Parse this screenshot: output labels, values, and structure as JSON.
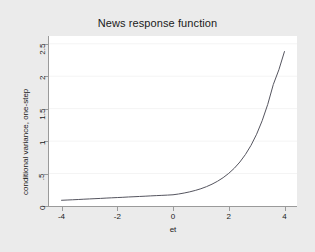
{
  "chart_data": {
    "type": "line",
    "title": "News response function",
    "xlabel": "et",
    "ylabel": "conditional variance, one-step",
    "xlim": [
      -4.45,
      4.45
    ],
    "ylim": [
      0,
      2.62
    ],
    "xticks": [
      "-4",
      "-2",
      "0",
      "2",
      "4"
    ],
    "xtick_values": [
      -4,
      -2,
      0,
      2,
      4
    ],
    "yticks": [
      "0",
      ".5",
      "1",
      "1.5",
      "2",
      "2.5"
    ],
    "ytick_values": [
      0,
      0.5,
      1,
      1.5,
      2,
      2.5
    ],
    "grid": true,
    "grid_axis": "y",
    "legend": "none",
    "series": [
      {
        "name": "conditional variance, one-step",
        "color": "#55555f",
        "x": [
          -4.0,
          -3.8,
          -3.6,
          -3.4,
          -3.2,
          -3.0,
          -2.8,
          -2.6,
          -2.4,
          -2.2,
          -2.0,
          -1.8,
          -1.6,
          -1.4,
          -1.2,
          -1.0,
          -0.8,
          -0.6,
          -0.4,
          -0.2,
          0.0,
          0.2,
          0.4,
          0.6,
          0.8,
          1.0,
          1.2,
          1.4,
          1.6,
          1.8,
          2.0,
          2.2,
          2.4,
          2.6,
          2.8,
          3.0,
          3.2,
          3.4,
          3.6,
          3.8,
          4.0
        ],
        "y": [
          0.088,
          0.092,
          0.096,
          0.1,
          0.105,
          0.109,
          0.113,
          0.117,
          0.122,
          0.126,
          0.13,
          0.134,
          0.139,
          0.143,
          0.147,
          0.151,
          0.156,
          0.16,
          0.164,
          0.168,
          0.173,
          0.185,
          0.2,
          0.218,
          0.24,
          0.266,
          0.298,
          0.336,
          0.382,
          0.437,
          0.503,
          0.582,
          0.678,
          0.794,
          0.935,
          1.106,
          1.314,
          1.566,
          1.872,
          2.1,
          2.38
        ]
      }
    ]
  },
  "figure": {
    "title": "News response function",
    "x_axis_title": "et",
    "y_axis_title": "conditional variance, one-step",
    "background_color": "#ebebeb",
    "plot_background_color": "#ffffff",
    "line_color": "#55555f",
    "axis_color": "#9a9a9a",
    "grid_color": "#f4f4f4"
  }
}
